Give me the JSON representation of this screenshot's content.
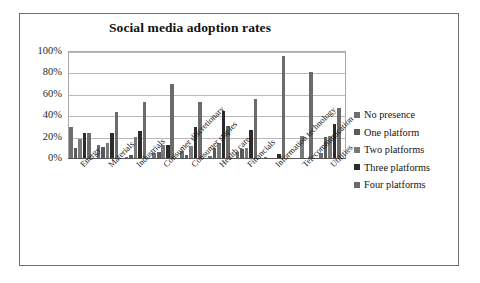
{
  "chart_data": {
    "type": "bar",
    "title": "Social media adoption rates",
    "xlabel": "",
    "ylabel": "",
    "ylim": [
      0,
      100
    ],
    "yticks": [
      "0%",
      "20%",
      "40%",
      "60%",
      "80%",
      "100%"
    ],
    "ytick_values": [
      0,
      20,
      40,
      60,
      80,
      100
    ],
    "grid": true,
    "legend_position": "right",
    "categories": [
      "Energy",
      "Materials",
      "Industrials",
      "Consumer discretionary",
      "Consumer staples",
      "Health care",
      "Financials",
      "Information technology",
      "Telecommunication",
      "Utilities"
    ],
    "series": [
      {
        "name": "No presence",
        "color": "#6e6e6e",
        "values": [
          29,
          12,
          1,
          5,
          7,
          2,
          6,
          1,
          0,
          5
        ]
      },
      {
        "name": "One platform",
        "color": "#5a5a5a",
        "values": [
          9,
          10,
          3,
          6,
          3,
          9,
          8,
          0,
          0,
          20
        ]
      },
      {
        "name": "Two platforms",
        "color": "#7a7a7a",
        "values": [
          18,
          14,
          20,
          12,
          11,
          14,
          9,
          0,
          21,
          21
        ]
      },
      {
        "name": "Three platforms",
        "color": "#2b2b2b",
        "values": [
          23,
          23,
          25,
          12,
          29,
          44,
          26,
          4,
          0,
          32
        ]
      },
      {
        "name": "Four platforms",
        "color": "#6b6b6b",
        "values": [
          23,
          43,
          52,
          69,
          52,
          30,
          55,
          95,
          80,
          47
        ]
      }
    ]
  }
}
